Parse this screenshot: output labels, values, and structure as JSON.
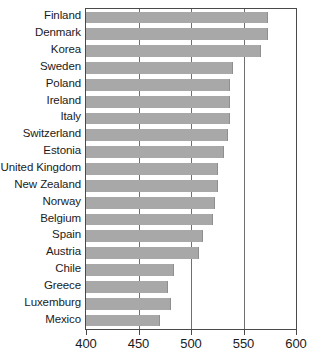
{
  "chart": {
    "title": "",
    "subtitle": "",
    "xlabel": "",
    "ylabel": ""
  },
  "axis": {
    "ticks": [
      "400",
      "450",
      "500",
      "550",
      "600"
    ],
    "min": 400,
    "max": 600
  },
  "style": {
    "bar_color": "#a8a8a8",
    "bar_edge_color": "#8f8f8f",
    "frame_color": "#4a4a4a",
    "gridline_color": "#6f6f6f",
    "text_color": "#1b1b1b",
    "background": "#ffffff"
  },
  "chart_data": {
    "type": "bar",
    "orientation": "horizontal",
    "title": "",
    "xlabel": "",
    "ylabel": "",
    "xlim": [
      400,
      600
    ],
    "grid": true,
    "gridlines": [
      450,
      500,
      550
    ],
    "legend": null,
    "categories": [
      "Finland",
      "Denmark",
      "Korea",
      "Sweden",
      "Poland",
      "Ireland",
      "Italy",
      "Switzerland",
      "Estonia",
      "United Kingdom",
      "New Zealand",
      "Norway",
      "Belgium",
      "Spain",
      "Austria",
      "Chile",
      "Greece",
      "Luxemburg",
      "Mexico"
    ],
    "values": [
      573,
      573,
      567,
      540,
      537,
      537,
      537,
      535,
      531,
      526,
      526,
      523,
      521,
      511,
      508,
      484,
      478,
      481,
      470
    ],
    "ticklabels": [
      "400",
      "450",
      "500",
      "550",
      "600"
    ],
    "tickvalues": [
      400,
      450,
      500,
      550,
      600
    ]
  }
}
